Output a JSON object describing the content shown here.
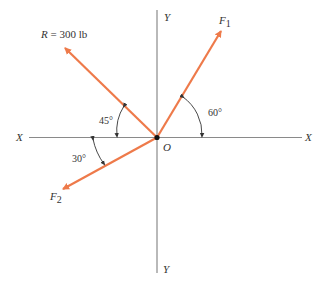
{
  "diagram": {
    "type": "force-vector-diagram",
    "colors": {
      "vector": "#EE7A4A",
      "axis": "#8a8a8a",
      "text": "#333333",
      "origin": "#111111"
    },
    "axes": {
      "x_left_label": "X",
      "x_right_label": "X",
      "y_top_label": "Y",
      "y_bottom_label": "Y",
      "origin_label": "O"
    },
    "vectors": [
      {
        "id": "R",
        "label_italic": "R",
        "label_rest": " = 300 lb",
        "angle_label": "45°",
        "direction": "upper-left",
        "angle_from_neg_x": 45
      },
      {
        "id": "F1",
        "label_main": "F",
        "label_sub": "1",
        "angle_label": "60°",
        "direction": "upper-right",
        "angle_from_pos_x": 60
      },
      {
        "id": "F2",
        "label_main": "F",
        "label_sub": "2",
        "angle_label": "30°",
        "direction": "lower-left",
        "angle_from_neg_x": 30
      }
    ]
  }
}
